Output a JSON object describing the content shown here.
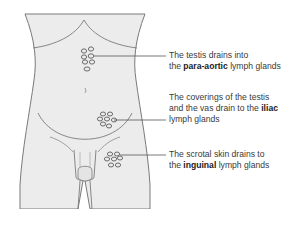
{
  "diagram": {
    "type": "anatomical illustration",
    "colors": {
      "body_fill": "#ececec",
      "outline": "#7a7a7a",
      "node_stroke": "#6a6a6a",
      "text": "#3a3a3a"
    },
    "labels": [
      {
        "id": "para-aortic",
        "line1": "The testis drains into",
        "line2_pre": "the ",
        "line2_bold": "para-aortic",
        "line2_post": " lymph glands"
      },
      {
        "id": "iliac",
        "line1": "The coverings of the testis",
        "line2_pre": "and the vas drain to the ",
        "line2_bold": "iliac",
        "line2_post": "",
        "line3": "lymph glands"
      },
      {
        "id": "inguinal",
        "line1": "The scrotal skin drains to",
        "line2_pre": "the ",
        "line2_bold": "inguinal",
        "line2_post": " lymph glands"
      }
    ]
  }
}
